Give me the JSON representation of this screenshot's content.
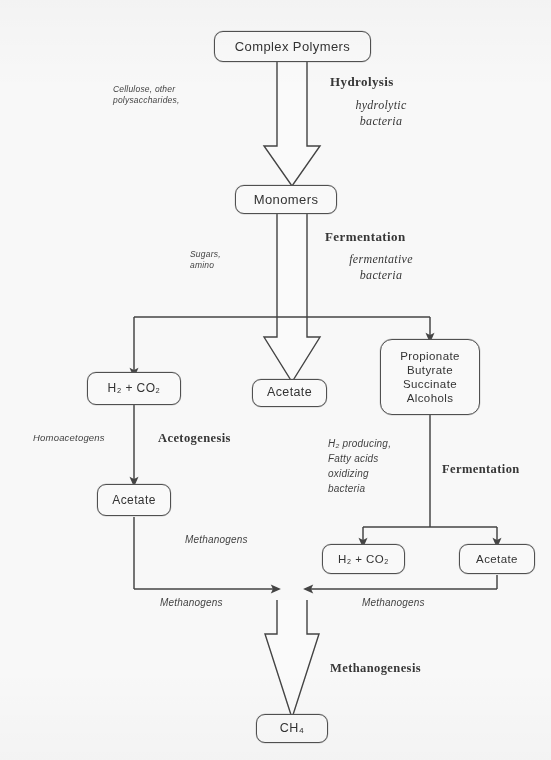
{
  "diagram": {
    "title_fragment": "",
    "type": "flowchart",
    "colors": {
      "line": "#3c3c3c",
      "box_border": "#4a4a4a",
      "text": "#2b2b2b",
      "background": "#fdfdfd"
    }
  },
  "nodes": {
    "complex_polymers": {
      "label": "Complex Polymers"
    },
    "monomers": {
      "label": "Monomers"
    },
    "h2co2_left": {
      "lines": [
        "H₂ + CO₂"
      ]
    },
    "acetate_center": {
      "label": "Acetate"
    },
    "organics_right": {
      "lines": [
        "Propionate",
        "Butyrate",
        "Succinate",
        "Alcohols"
      ]
    },
    "acetate_left": {
      "label": "Acetate"
    },
    "h2co2_right": {
      "lines": [
        "H₂ + CO₂"
      ]
    },
    "acetate_right": {
      "label": "Acetate"
    },
    "methane": {
      "label": "CH₄"
    }
  },
  "labels": {
    "substrate_polymers": "Cellulose, other\npolysaccharides,",
    "hydrolysis_stage": "Hydrolysis",
    "hydrolytic_bacteria": "hydrolytic\nbacteria",
    "substrate_monomers": "Sugars,\namino",
    "fermentation_stage": "Fermentation",
    "fermentative_bacteria": "fermentative\nbacteria",
    "homoacetogens": "Homoacetogens",
    "acetogenesis_stage": "Acetogenesis",
    "h2_producing_bacteria": "H₂ producing,\nFatty acids\noxidizing\nbacteria",
    "fermentation_stage_right": "Fermentation",
    "methanogens_center": "Methanogens",
    "methanogens_left": "Methanogens",
    "methanogens_right": "Methanogens",
    "methanogenesis_stage": "Methanogenesis"
  }
}
